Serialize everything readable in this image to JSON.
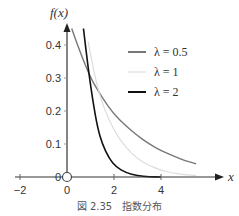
{
  "chart_data": {
    "type": "line",
    "title": "",
    "caption": "図 2.35　指数分布",
    "xlabel": "x",
    "ylabel": "f(x)",
    "xlim": [
      -2,
      6.5
    ],
    "ylim": [
      0,
      0.45
    ],
    "xticks": [
      "-2",
      "0",
      "2",
      "4"
    ],
    "yticks": [
      "0",
      "0.1",
      "0.2",
      "0.3",
      "0.4"
    ],
    "grid": false,
    "legend_position": "upper right",
    "series": [
      {
        "name": "λ = 0.5",
        "color": "#777777",
        "x": [
          0.2,
          0.5,
          1,
          1.5,
          2,
          2.5,
          3,
          3.5,
          4,
          4.5,
          5,
          5.5
        ],
        "values": [
          0.45,
          0.39,
          0.3,
          0.24,
          0.19,
          0.155,
          0.125,
          0.1,
          0.08,
          0.065,
          0.05,
          0.04
        ]
      },
      {
        "name": "λ = 1",
        "color": "#dddddd",
        "x": [
          0.9,
          1.2,
          1.5,
          2,
          2.5,
          3,
          3.5,
          4,
          4.5,
          5,
          5.5
        ],
        "values": [
          0.41,
          0.3,
          0.22,
          0.14,
          0.09,
          0.055,
          0.035,
          0.02,
          0.012,
          0.007,
          0.004
        ]
      },
      {
        "name": "λ = 2",
        "color": "#111111",
        "x": [
          0.7,
          0.9,
          1.1,
          1.3,
          1.5,
          1.8,
          2.1,
          2.5,
          3,
          3.5,
          4
        ],
        "values": [
          0.45,
          0.33,
          0.23,
          0.15,
          0.1,
          0.055,
          0.03,
          0.013,
          0.004,
          0.001,
          0.0
        ]
      }
    ]
  },
  "labels": {
    "y_axis": "f(x)",
    "x_axis": "x",
    "origin_zero": "0",
    "legend": [
      "λ = 0.5",
      "λ = 1",
      "λ = 2"
    ],
    "caption": "図 2.35　指数分布"
  }
}
